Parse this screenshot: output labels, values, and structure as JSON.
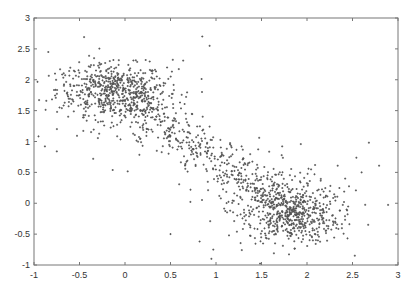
{
  "chart_data": {
    "type": "scatter",
    "title": "",
    "xlabel": "",
    "ylabel": "",
    "xlim": [
      -1,
      3
    ],
    "ylim": [
      -1,
      3
    ],
    "grid": false,
    "legend": null,
    "x_ticks": [
      -1,
      -0.5,
      0,
      0.5,
      1,
      1.5,
      2,
      2.5,
      3
    ],
    "x_tick_labels": [
      "-1",
      "-0.5",
      "0",
      "0.5",
      "1",
      "1.5",
      "2",
      "2.5",
      "3"
    ],
    "y_ticks": [
      -1,
      -0.5,
      0,
      0.5,
      1,
      1.5,
      2,
      2.5,
      3
    ],
    "y_tick_labels": [
      "-1",
      "-0.5",
      "0",
      "0.5",
      "1",
      "1.5",
      "2",
      "2.5",
      "3"
    ],
    "marker": "+",
    "marker_color": "#555555",
    "axis_color": "#777777",
    "clusters": [
      {
        "name": "upper-left cluster",
        "center": [
          -0.15,
          1.85
        ],
        "spread": [
          0.3,
          0.2
        ],
        "count": 420
      },
      {
        "name": "lower-right cluster",
        "center": [
          1.85,
          -0.2
        ],
        "spread": [
          0.25,
          0.22
        ],
        "count": 420
      },
      {
        "name": "diagonal bridge",
        "from": [
          0.0,
          1.7
        ],
        "to": [
          1.7,
          0.0
        ],
        "width": 0.3,
        "count": 450
      },
      {
        "name": "upper-left scatter",
        "center": [
          0.0,
          1.7
        ],
        "spread": [
          0.4,
          0.35
        ],
        "count": 200
      },
      {
        "name": "lower-right scatter",
        "center": [
          1.8,
          0.0
        ],
        "spread": [
          0.4,
          0.35
        ],
        "count": 200
      }
    ],
    "outliers": [
      [
        -0.88,
        0.92
      ],
      [
        -0.75,
        0.84
      ],
      [
        -0.35,
        0.72
      ],
      [
        0.85,
        2.7
      ],
      [
        0.93,
        2.55
      ],
      [
        0.72,
        0.22
      ],
      [
        0.97,
        -0.75
      ],
      [
        0.95,
        -0.9
      ],
      [
        1.65,
        -0.65
      ],
      [
        2.68,
        0.98
      ],
      [
        2.6,
        0.5
      ],
      [
        0.5,
        -0.5
      ],
      [
        0.82,
        -0.62
      ]
    ]
  }
}
